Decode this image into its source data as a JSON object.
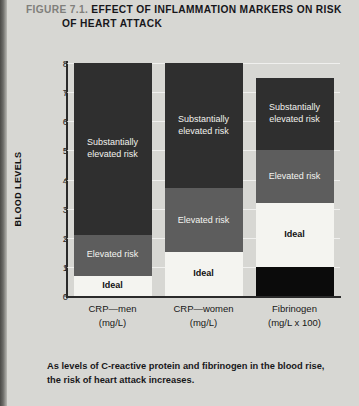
{
  "figure": {
    "number": "FIGURE 7.1.",
    "title_line1": "EFFECT OF INFLAMMATION MARKERS ON RISK",
    "title_line2": "OF HEART ATTACK",
    "caption": "As levels of C-reactive protein and fibrinogen in the blood rise, the risk of heart attack increases."
  },
  "chart_data": {
    "type": "bar",
    "subtype": "stacked",
    "title": "EFFECT OF INFLAMMATION MARKERS ON RISK OF HEART ATTACK",
    "xlabel": "",
    "ylabel": "BLOOD LEVELS",
    "ylim": [
      0,
      8
    ],
    "yticks": [
      0,
      1,
      2,
      3,
      4,
      5,
      6,
      7,
      8
    ],
    "ytick_labels": [
      "0",
      "1",
      "2",
      "3",
      "4",
      "5",
      "6",
      "7",
      "8"
    ],
    "grid": true,
    "legend": "none",
    "categories": [
      {
        "name": "CRP—men",
        "unit": "(mg/L)"
      },
      {
        "name": "CRP—women",
        "unit": "(mg/L)"
      },
      {
        "name": "Fibrinogen",
        "unit": "(mg/L x 100)"
      }
    ],
    "series": [
      {
        "name": "Ideal",
        "values": [
          0.7,
          1.5,
          2.2
        ]
      },
      {
        "name": "Elevated risk",
        "values": [
          1.4,
          2.2,
          1.8
        ]
      },
      {
        "name": "Substantially elevated risk",
        "values": [
          5.9,
          4.3,
          2.5
        ]
      }
    ],
    "bars": [
      {
        "category": "CRP—men",
        "unit": "(mg/L)",
        "total": 8.0,
        "segments": [
          {
            "label": "Ideal",
            "from": 0.0,
            "to": 0.7,
            "color": "#f4f4f0"
          },
          {
            "label": "Elevated risk",
            "from": 0.7,
            "to": 2.1,
            "color": "#5d5d5d"
          },
          {
            "label": "Substantially\nelevated risk",
            "from": 2.1,
            "to": 8.0,
            "color": "#2f2f2f"
          }
        ]
      },
      {
        "category": "CRP—women",
        "unit": "(mg/L)",
        "total": 8.0,
        "segments": [
          {
            "label": "Ideal",
            "from": 0.0,
            "to": 1.5,
            "color": "#f4f4f0"
          },
          {
            "label": "Elevated risk",
            "from": 1.5,
            "to": 3.7,
            "color": "#5d5d5d"
          },
          {
            "label": "Substantially\nelevated risk",
            "from": 3.7,
            "to": 8.0,
            "color": "#2f2f2f"
          }
        ]
      },
      {
        "category": "Fibrinogen",
        "unit": "(mg/L x 100)",
        "total": 7.5,
        "segments": [
          {
            "label": "",
            "from": 0.0,
            "to": 1.0,
            "color": "#0b0b0b"
          },
          {
            "label": "Ideal",
            "from": 1.0,
            "to": 3.2,
            "color": "#f4f4f0"
          },
          {
            "label": "Elevated risk",
            "from": 3.2,
            "to": 5.0,
            "color": "#5d5d5d"
          },
          {
            "label": "Substantially\nelevated risk",
            "from": 5.0,
            "to": 7.5,
            "color": "#2f2f2f"
          }
        ]
      }
    ]
  },
  "colors": {
    "page_background": "#d7d7d3",
    "ideal": "#f4f4f0",
    "elevated": "#5d5d5d",
    "substantial": "#2f2f2f",
    "base_black": "#0b0b0b",
    "axis": "#2a2a2a"
  }
}
